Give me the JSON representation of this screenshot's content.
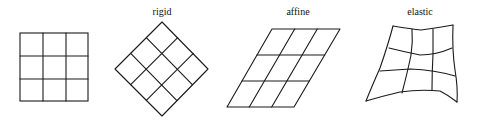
{
  "figure": {
    "panels": [
      {
        "id": "original",
        "label": ""
      },
      {
        "id": "rigid",
        "label": "rigid"
      },
      {
        "id": "affine",
        "label": "affine"
      },
      {
        "id": "elastic",
        "label": "elastic"
      }
    ]
  },
  "colors": {
    "background": "#ffffff",
    "stroke": "#1a1a1a",
    "text": "#111111"
  }
}
